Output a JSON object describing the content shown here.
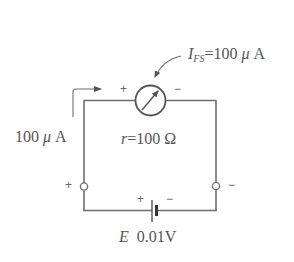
{
  "diagram": {
    "type": "circuit",
    "meter": {
      "symbol": "galvanometer-circle-with-arrow",
      "full_scale_current_symbol": "I",
      "full_scale_current_subscript": "FS",
      "full_scale_current_equals": "=",
      "full_scale_current_value": "100",
      "full_scale_current_unit_prefix": "μ",
      "full_scale_current_unit": "A",
      "plus_label": "+",
      "minus_label": "−"
    },
    "internal_resistance": {
      "symbol": "r",
      "equals": "=",
      "value": "100",
      "unit": "Ω"
    },
    "current_arrow": {
      "value": "100",
      "unit_prefix": "μ",
      "unit": "A"
    },
    "terminals": {
      "left_label": "+",
      "right_label": "−"
    },
    "battery": {
      "symbol": "E",
      "value": "0.01V",
      "plus_label": "+",
      "minus_label": "−"
    },
    "colors": {
      "line": "#6e6e6e",
      "text": "#555555",
      "background": "#ffffff"
    }
  }
}
